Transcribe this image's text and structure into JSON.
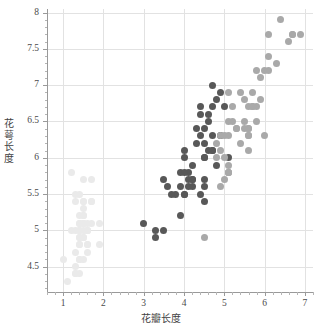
{
  "chart_data": {
    "type": "scatter",
    "title": "",
    "xlabel": "花瓣长度",
    "ylabel": "花萼长度",
    "xlim": [
      0.6,
      7.2
    ],
    "ylim": [
      4.15,
      8.05
    ],
    "xticks": [
      "1",
      "2",
      "3",
      "4",
      "5",
      "6",
      "7"
    ],
    "xtick_values": [
      1,
      2,
      3,
      4,
      5,
      6,
      7
    ],
    "yticks": [
      "4.5",
      "5",
      "5.5",
      "6",
      "6.5",
      "7",
      "7.5",
      "8"
    ],
    "ytick_values": [
      4.5,
      5,
      5.5,
      6,
      6.5,
      7,
      7.5,
      8
    ],
    "grid": true,
    "legend": "none",
    "series": [
      {
        "name": "setosa",
        "color": "#eaeaea",
        "points": [
          [
            1.4,
            5.1
          ],
          [
            1.4,
            4.9
          ],
          [
            1.3,
            4.7
          ],
          [
            1.5,
            4.6
          ],
          [
            1.4,
            5.0
          ],
          [
            1.7,
            5.4
          ],
          [
            1.4,
            4.6
          ],
          [
            1.5,
            5.0
          ],
          [
            1.4,
            4.4
          ],
          [
            1.5,
            4.9
          ],
          [
            1.5,
            5.4
          ],
          [
            1.6,
            4.8
          ],
          [
            1.4,
            4.8
          ],
          [
            1.1,
            4.3
          ],
          [
            1.2,
            5.8
          ],
          [
            1.5,
            5.7
          ],
          [
            1.3,
            5.4
          ],
          [
            1.4,
            5.1
          ],
          [
            1.7,
            5.7
          ],
          [
            1.5,
            5.1
          ],
          [
            1.7,
            5.4
          ],
          [
            1.5,
            5.1
          ],
          [
            1.0,
            4.6
          ],
          [
            1.7,
            5.1
          ],
          [
            1.9,
            4.8
          ],
          [
            1.6,
            5.0
          ],
          [
            1.6,
            5.0
          ],
          [
            1.5,
            5.2
          ],
          [
            1.4,
            5.2
          ],
          [
            1.6,
            4.7
          ],
          [
            1.6,
            4.8
          ],
          [
            1.5,
            5.4
          ],
          [
            1.5,
            5.2
          ],
          [
            1.4,
            5.5
          ],
          [
            1.5,
            4.9
          ],
          [
            1.2,
            5.0
          ],
          [
            1.3,
            5.5
          ],
          [
            1.4,
            4.9
          ],
          [
            1.3,
            4.4
          ],
          [
            1.5,
            5.1
          ],
          [
            1.3,
            5.0
          ],
          [
            1.3,
            4.5
          ],
          [
            1.3,
            4.4
          ],
          [
            1.6,
            5.0
          ],
          [
            1.9,
            5.1
          ],
          [
            1.4,
            4.8
          ],
          [
            1.6,
            5.1
          ],
          [
            1.4,
            4.6
          ],
          [
            1.5,
            5.3
          ],
          [
            1.4,
            5.0
          ]
        ]
      },
      {
        "name": "versicolor",
        "color": "#585858",
        "points": [
          [
            4.7,
            7.0
          ],
          [
            4.5,
            6.4
          ],
          [
            4.9,
            6.9
          ],
          [
            4.0,
            5.5
          ],
          [
            4.6,
            6.5
          ],
          [
            4.5,
            5.7
          ],
          [
            4.7,
            6.3
          ],
          [
            3.3,
            4.9
          ],
          [
            4.6,
            6.6
          ],
          [
            3.9,
            5.2
          ],
          [
            3.5,
            5.0
          ],
          [
            4.2,
            5.9
          ],
          [
            4.0,
            6.0
          ],
          [
            4.7,
            6.1
          ],
          [
            3.6,
            5.6
          ],
          [
            4.4,
            6.7
          ],
          [
            4.5,
            5.6
          ],
          [
            4.1,
            5.8
          ],
          [
            4.5,
            6.2
          ],
          [
            3.9,
            5.6
          ],
          [
            4.8,
            5.9
          ],
          [
            4.0,
            6.1
          ],
          [
            4.9,
            6.3
          ],
          [
            4.7,
            6.1
          ],
          [
            4.3,
            6.4
          ],
          [
            4.4,
            6.6
          ],
          [
            4.8,
            6.8
          ],
          [
            5.0,
            6.7
          ],
          [
            4.5,
            6.0
          ],
          [
            3.5,
            5.7
          ],
          [
            3.8,
            5.5
          ],
          [
            3.7,
            5.5
          ],
          [
            3.9,
            5.8
          ],
          [
            5.1,
            6.0
          ],
          [
            4.5,
            5.4
          ],
          [
            4.5,
            6.0
          ],
          [
            4.7,
            6.7
          ],
          [
            4.4,
            6.3
          ],
          [
            4.1,
            5.6
          ],
          [
            4.0,
            5.5
          ],
          [
            4.4,
            5.5
          ],
          [
            4.6,
            6.1
          ],
          [
            4.0,
            5.8
          ],
          [
            3.3,
            5.0
          ],
          [
            4.2,
            5.6
          ],
          [
            4.2,
            5.7
          ],
          [
            4.2,
            5.7
          ],
          [
            4.3,
            6.2
          ],
          [
            3.0,
            5.1
          ],
          [
            4.1,
            5.7
          ]
        ]
      },
      {
        "name": "virginica",
        "color": "#a9a9a9",
        "points": [
          [
            6.0,
            6.3
          ],
          [
            5.1,
            5.8
          ],
          [
            5.9,
            7.1
          ],
          [
            5.6,
            6.3
          ],
          [
            5.8,
            6.5
          ],
          [
            6.6,
            7.6
          ],
          [
            4.5,
            4.9
          ],
          [
            6.3,
            7.3
          ],
          [
            5.8,
            6.7
          ],
          [
            6.1,
            7.2
          ],
          [
            5.1,
            6.5
          ],
          [
            5.3,
            6.4
          ],
          [
            5.5,
            6.8
          ],
          [
            5.0,
            5.7
          ],
          [
            5.1,
            5.8
          ],
          [
            5.3,
            6.4
          ],
          [
            5.5,
            6.5
          ],
          [
            6.7,
            7.7
          ],
          [
            6.9,
            7.7
          ],
          [
            5.0,
            6.0
          ],
          [
            5.7,
            6.9
          ],
          [
            4.9,
            5.6
          ],
          [
            6.7,
            7.7
          ],
          [
            4.9,
            6.3
          ],
          [
            5.7,
            6.7
          ],
          [
            6.0,
            7.2
          ],
          [
            4.8,
            6.2
          ],
          [
            4.9,
            6.1
          ],
          [
            5.6,
            6.4
          ],
          [
            5.8,
            7.2
          ],
          [
            6.1,
            7.4
          ],
          [
            6.4,
            7.9
          ],
          [
            5.6,
            6.4
          ],
          [
            5.1,
            6.3
          ],
          [
            5.6,
            6.1
          ],
          [
            6.1,
            7.7
          ],
          [
            5.6,
            6.3
          ],
          [
            5.5,
            6.4
          ],
          [
            4.8,
            6.0
          ],
          [
            5.4,
            6.9
          ],
          [
            5.6,
            6.7
          ],
          [
            5.1,
            6.9
          ],
          [
            5.1,
            5.8
          ],
          [
            5.9,
            6.8
          ],
          [
            5.7,
            6.7
          ],
          [
            5.2,
            6.7
          ],
          [
            5.0,
            6.3
          ],
          [
            5.2,
            6.5
          ],
          [
            5.4,
            6.2
          ],
          [
            5.1,
            5.9
          ]
        ]
      }
    ]
  },
  "axes": {
    "xlabel_text": "花瓣长度",
    "ylabel_chars": [
      "花",
      "萼",
      "长",
      "度"
    ]
  }
}
